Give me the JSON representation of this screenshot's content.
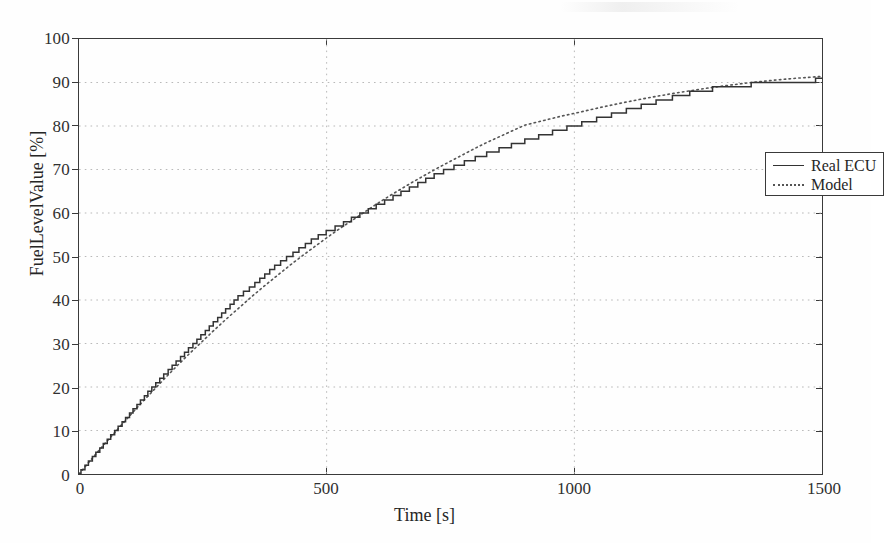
{
  "chart_data": {
    "type": "line",
    "title": "",
    "subtitle": "",
    "xlabel": "Time [s]",
    "ylabel": "FuelLevelValue [%]",
    "xlim": [
      0,
      1500
    ],
    "ylim": [
      0,
      100
    ],
    "xticks": [
      0,
      500,
      1000,
      1500
    ],
    "yticks": [
      0,
      10,
      20,
      30,
      40,
      50,
      60,
      70,
      80,
      90,
      100
    ],
    "xtick_labels": [
      "0",
      "500",
      "1000",
      "1500"
    ],
    "ytick_labels": [
      "0",
      "10",
      "20",
      "30",
      "40",
      "50",
      "60",
      "70",
      "80",
      "90",
      "100"
    ],
    "grid": true,
    "grid_style": "dotted",
    "grid_color": "#b9b9b9",
    "legend_position": "center-right",
    "series": [
      {
        "name": "Real ECU",
        "style": "solid",
        "color": "#333333",
        "note": "quantized staircase signal, step size about 1 percent",
        "x": [
          0,
          15,
          30,
          45,
          60,
          75,
          90,
          105,
          120,
          135,
          150,
          175,
          200,
          225,
          250,
          275,
          300,
          325,
          350,
          375,
          400,
          425,
          450,
          475,
          500,
          525,
          550,
          575,
          600,
          625,
          650,
          675,
          700,
          725,
          750,
          775,
          800,
          825,
          850,
          875,
          900,
          925,
          950,
          975,
          1000,
          1030,
          1060,
          1090,
          1120,
          1150,
          1180,
          1215,
          1250,
          1290,
          1330,
          1375,
          1420,
          1460,
          1500
        ],
        "y": [
          0,
          2,
          4,
          6,
          8,
          10,
          12,
          14,
          16,
          18,
          20,
          23,
          26,
          29,
          32,
          35,
          38,
          41,
          43,
          45.5,
          48,
          50,
          52,
          54,
          55.6,
          57,
          58.5,
          60,
          61.5,
          63,
          64.5,
          66,
          67.5,
          69,
          70.2,
          71.4,
          72.5,
          73.6,
          74.6,
          75.6,
          76.5,
          77.4,
          78.3,
          79.2,
          80,
          81,
          82,
          83,
          84,
          85,
          86,
          87,
          88,
          88.7,
          89.2,
          89.7,
          90,
          90.3,
          90.6
        ]
      },
      {
        "name": "Model",
        "style": "dotted",
        "color": "#555555",
        "note": "smooth exponential saturation model, slightly above the ECU trace after 1000 s",
        "x": [
          0,
          25,
          50,
          75,
          100,
          125,
          150,
          175,
          200,
          225,
          250,
          275,
          300,
          325,
          350,
          375,
          400,
          425,
          450,
          475,
          500,
          525,
          550,
          575,
          600,
          625,
          650,
          675,
          700,
          725,
          750,
          775,
          800,
          825,
          850,
          875,
          900,
          925,
          950,
          975,
          1000,
          1050,
          1100,
          1150,
          1200,
          1250,
          1300,
          1350,
          1400,
          1450,
          1500
        ],
        "y": [
          0,
          3.4,
          6.7,
          9.9,
          13.1,
          16.2,
          19.2,
          22.2,
          25.1,
          27.9,
          30.6,
          33.3,
          35.9,
          38.4,
          40.9,
          43.3,
          45.6,
          47.9,
          50.1,
          52.2,
          54.3,
          56.3,
          58.2,
          60.1,
          62,
          63.8,
          65.5,
          67.2,
          68.8,
          70.4,
          71.9,
          73.4,
          74.9,
          76.3,
          77.6,
          78.9,
          80.2,
          80.9,
          81.6,
          82.3,
          82.9,
          84.2,
          85.4,
          86.5,
          87.5,
          88.4,
          89.2,
          89.9,
          90.5,
          91,
          91.4
        ]
      }
    ]
  },
  "axes": {
    "y_axis_title": "FuelLevelValue [%]",
    "x_axis_title": "Time [s]"
  },
  "legend": {
    "entries": [
      {
        "label": "Real ECU",
        "style": "solid"
      },
      {
        "label": "Model",
        "style": "dotted"
      }
    ]
  }
}
